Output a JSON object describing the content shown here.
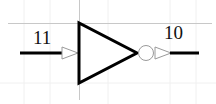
{
  "diagram": {
    "type": "logic-gate",
    "gate": "inverter",
    "input_pin": {
      "label": "11"
    },
    "output_pin": {
      "label": "10"
    }
  },
  "colors": {
    "background": "#ffffff",
    "stroke": "#000000",
    "grid": "#c8c8c8",
    "faint_grid": "#eeeeee",
    "arrow": "#9a9a9a"
  }
}
